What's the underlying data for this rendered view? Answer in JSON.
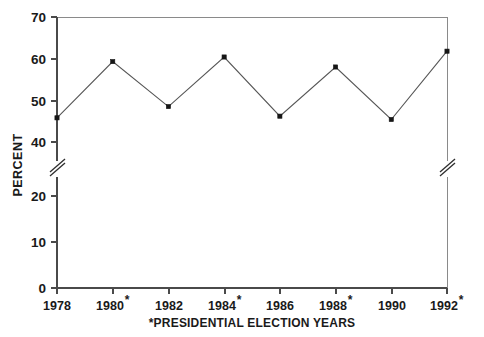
{
  "chart_data": {
    "type": "line",
    "title": "",
    "xlabel": "",
    "ylabel": "PERCENT",
    "categories": [
      "1978",
      "1980*",
      "1982",
      "1984*",
      "1986",
      "1988*",
      "1990",
      "1992*"
    ],
    "x": [
      1978,
      1980,
      1982,
      1984,
      1986,
      1988,
      1990,
      1992
    ],
    "values": [
      45.8,
      59.3,
      48.5,
      60.4,
      46.2,
      58.0,
      45.4,
      61.8
    ],
    "series": [
      {
        "name": "PERCENT",
        "values": [
          45.8,
          59.3,
          48.5,
          60.4,
          46.2,
          58.0,
          45.4,
          61.8
        ]
      }
    ],
    "ylim": [
      0,
      70
    ],
    "ytick_labels": [
      "0",
      "10",
      "20",
      "40",
      "50",
      "60",
      "70"
    ],
    "ytick_values": [
      0,
      10,
      20,
      40,
      50,
      60,
      70
    ],
    "axis_break": {
      "present": true,
      "between": [
        20,
        40
      ],
      "skipped_tick": "30",
      "symbol": "double-slash"
    },
    "grid": false,
    "legend": false,
    "legend_position": "none",
    "markers": "filled-square",
    "footnote": "*PRESIDENTIAL ELECTION YEARS",
    "annotations": [
      "*PRESIDENTIAL ELECTION YEARS"
    ],
    "election_year_marks": [
      "1980",
      "1984",
      "1988",
      "1992"
    ]
  },
  "axis": {
    "y_title": "PERCENT",
    "y_ticks": [
      {
        "label": "70",
        "value": 70
      },
      {
        "label": "60",
        "value": 60
      },
      {
        "label": "50",
        "value": 50
      },
      {
        "label": "40",
        "value": 40
      },
      {
        "label": "20",
        "value": 20
      },
      {
        "label": "10",
        "value": 10
      },
      {
        "label": "0",
        "value": 0
      }
    ],
    "x_ticks": [
      {
        "label": "1978",
        "star": ""
      },
      {
        "label": "1980",
        "star": "*"
      },
      {
        "label": "1982",
        "star": ""
      },
      {
        "label": "1984",
        "star": "*"
      },
      {
        "label": "1986",
        "star": ""
      },
      {
        "label": "1988",
        "star": "*"
      },
      {
        "label": "1990",
        "star": ""
      },
      {
        "label": "1992",
        "star": "*"
      }
    ]
  },
  "footnote": {
    "text": "*PRESIDENTIAL ELECTION YEARS"
  },
  "colors": {
    "line": "#565656",
    "marker": "#161616",
    "axis": "#4a4a4a",
    "frame": "#8a8a8a",
    "text": "#1a1a1a",
    "background": "#ffffff"
  }
}
